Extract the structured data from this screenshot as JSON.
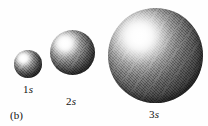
{
  "figure": {
    "panel_label": "(b)",
    "background_color": "#fefefe",
    "text_color": "#111111",
    "width": 208,
    "height": 126
  },
  "chart_data": {
    "type": "scatter",
    "title": "",
    "subtitle": "",
    "xlabel": "",
    "ylabel": "",
    "categories": [
      "1s",
      "2s",
      "3s"
    ],
    "values": [
      28,
      45,
      95
    ],
    "value_units": "px diameter",
    "annotations": [
      "(b)"
    ],
    "legend": [],
    "grid": false
  },
  "orbitals": [
    {
      "id": "1s",
      "label_prefix": "1",
      "label_suffix": "s",
      "diameter": 28,
      "x": 14,
      "y": 50,
      "highlight": "#ffffff",
      "rim_color": "#232323"
    },
    {
      "id": "2s",
      "label_prefix": "2",
      "label_suffix": "s",
      "diameter": 45,
      "x": 50,
      "y": 30,
      "highlight": "#ffffff",
      "rim_color": "#232323"
    },
    {
      "id": "3s",
      "label_prefix": "3",
      "label_suffix": "s",
      "diameter": 95,
      "x": 108,
      "y": 8,
      "highlight": "#ffffff",
      "rim_color": "#232323"
    }
  ]
}
